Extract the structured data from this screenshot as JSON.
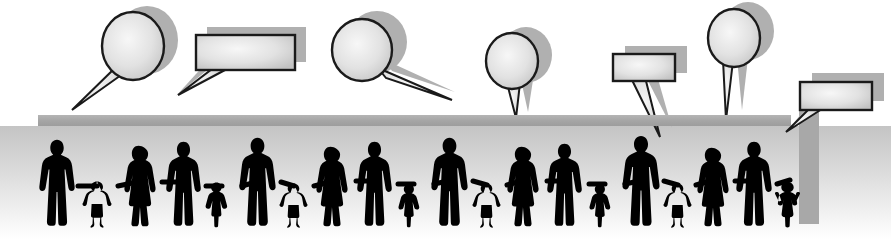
{
  "image": {
    "title": "People holding hands with speech bubbles",
    "width": 891,
    "height": 239,
    "background_color": "#ffffff",
    "silhouette_color": "#000000",
    "shadow_color": "#a8a8a8",
    "bubble_fill_center": "#f2f2f2",
    "bubble_fill_edge": "#c9c9c9",
    "bubble_outline_color": "#1a1a1a",
    "bar_color": "#a8a8a8",
    "floor_gradient_top": "#c6c6c6",
    "floor_gradient_bottom": "#ffffff"
  },
  "bars": [
    {
      "name": "horizontal-divider-bar",
      "x": 38,
      "y": 115,
      "width": 753,
      "height": 11,
      "color": "#a8a8a8"
    },
    {
      "name": "vertical-right-bar",
      "x": 799,
      "y": 100,
      "width": 20,
      "height": 124,
      "color": "#a8a8a8"
    }
  ],
  "speech_bubbles": [
    {
      "id": 1,
      "shape": "round",
      "label": "speech-bubble-round-1",
      "cx": 133,
      "cy": 46,
      "rx": 31,
      "ry": 34,
      "tail": "down-left-long",
      "tail_to_x": 70,
      "tail_to_y": 108,
      "text": ""
    },
    {
      "id": 2,
      "shape": "rectangular",
      "label": "speech-bubble-rect-1",
      "x": 196,
      "y": 35,
      "width": 99,
      "height": 35,
      "tail": "down-left-long",
      "tail_to_x": 178,
      "tail_to_y": 95,
      "text": ""
    },
    {
      "id": 3,
      "shape": "round",
      "label": "speech-bubble-round-2",
      "cx": 362,
      "cy": 50,
      "rx": 30,
      "ry": 31,
      "tail": "down-right-long",
      "tail_to_x": 450,
      "tail_to_y": 100,
      "text": ""
    },
    {
      "id": 4,
      "shape": "round",
      "label": "speech-bubble-round-3",
      "cx": 512,
      "cy": 61,
      "rx": 26,
      "ry": 28,
      "tail": "down-short",
      "tail_to_x": 516,
      "tail_to_y": 118,
      "text": ""
    },
    {
      "id": 5,
      "shape": "rectangular",
      "label": "speech-bubble-rect-2",
      "x": 613,
      "y": 54,
      "width": 62,
      "height": 27,
      "tail": "down-right-long",
      "tail_to_x": 660,
      "tail_to_y": 137,
      "text": ""
    },
    {
      "id": 6,
      "shape": "round",
      "label": "speech-bubble-round-4",
      "cx": 734,
      "cy": 38,
      "rx": 26,
      "ry": 29,
      "tail": "down-short",
      "tail_to_x": 726,
      "tail_to_y": 120,
      "text": ""
    },
    {
      "id": 7,
      "shape": "rectangular",
      "label": "speech-bubble-rect-3",
      "x": 800,
      "y": 82,
      "width": 72,
      "height": 28,
      "tail": "down-left-long",
      "tail_to_x": 786,
      "tail_to_y": 132,
      "text": ""
    }
  ],
  "people_chain": {
    "name": "people-holding-hands-row",
    "count": 21,
    "baseline_y": 228,
    "description": "Row of black silhouettes of adults and children holding hands",
    "figures": [
      {
        "index": 0,
        "type": "adult-man",
        "x": 46,
        "height": 90
      },
      {
        "index": 1,
        "type": "child-boy",
        "x": 93,
        "height": 48
      },
      {
        "index": 2,
        "type": "adult-woman",
        "x": 128,
        "height": 84
      },
      {
        "index": 3,
        "type": "adult-man",
        "x": 175,
        "height": 88
      },
      {
        "index": 4,
        "type": "child-girl",
        "x": 212,
        "height": 47
      },
      {
        "index": 5,
        "type": "adult-man",
        "x": 248,
        "height": 92
      },
      {
        "index": 6,
        "type": "child-boy",
        "x": 288,
        "height": 46
      },
      {
        "index": 7,
        "type": "adult-woman",
        "x": 321,
        "height": 83
      },
      {
        "index": 8,
        "type": "adult-man",
        "x": 366,
        "height": 88
      },
      {
        "index": 9,
        "type": "child-girl",
        "x": 405,
        "height": 45
      },
      {
        "index": 10,
        "type": "adult-man",
        "x": 440,
        "height": 92
      },
      {
        "index": 11,
        "type": "child-boy",
        "x": 481,
        "height": 46
      },
      {
        "index": 12,
        "type": "adult-woman",
        "x": 512,
        "height": 83
      },
      {
        "index": 13,
        "type": "adult-man",
        "x": 556,
        "height": 86
      },
      {
        "index": 14,
        "type": "child-girl",
        "x": 596,
        "height": 45
      },
      {
        "index": 15,
        "type": "adult-man",
        "x": 631,
        "height": 94
      },
      {
        "index": 16,
        "type": "child-boy",
        "x": 672,
        "height": 46
      },
      {
        "index": 17,
        "type": "adult-woman",
        "x": 701,
        "height": 82
      },
      {
        "index": 18,
        "type": "adult-man",
        "x": 744,
        "height": 88
      },
      {
        "index": 19,
        "type": "child-girl",
        "x": 784,
        "height": 48
      }
    ]
  }
}
